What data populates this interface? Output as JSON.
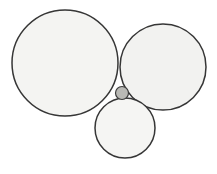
{
  "figure": {
    "background_color": "#ffffff",
    "width": 217,
    "height": 174
  },
  "style": {
    "stroke_color": "#363636",
    "stroke_width": 1.5,
    "large_fill": "#f4f4f2",
    "medium_fill": "#f2f2f0",
    "small_fill": "#f5f5f3",
    "inner_fill": "#b9b9b5"
  },
  "chart_data": {
    "type": "diagram",
    "xlim": [
      0,
      217
    ],
    "ylim": [
      0,
      174
    ],
    "grid": false,
    "legend": false,
    "circles": [
      {
        "name": "large-left-circle",
        "label": "Large left circle",
        "cx": 65,
        "cy": 63,
        "r": 53,
        "fill": "#f4f4f2",
        "stroke": "#363636",
        "stroke_width": 1.5
      },
      {
        "name": "medium-right-circle",
        "label": "Medium right circle",
        "cx": 163,
        "cy": 67,
        "r": 43,
        "fill": "#f2f2f0",
        "stroke": "#363636",
        "stroke_width": 1.5
      },
      {
        "name": "small-bottom-circle",
        "label": "Small bottom circle",
        "cx": 125,
        "cy": 128,
        "r": 30,
        "fill": "#f5f5f3",
        "stroke": "#363636",
        "stroke_width": 1.5
      },
      {
        "name": "inner-tangent-circle",
        "label": "Inner tangent circle",
        "cx": 122,
        "cy": 93,
        "r": 6.5,
        "fill": "#b9b9b5",
        "stroke": "#3c3c3c",
        "stroke_width": 1.2
      }
    ]
  }
}
